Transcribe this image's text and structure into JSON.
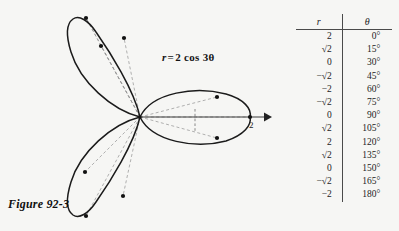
{
  "figure": {
    "caption": "Figure 92-3",
    "equation": {
      "lhs": "r",
      "equals": "=",
      "rhs": "2 cos 3θ",
      "full": "r = 2 cos 3θ"
    },
    "axis_label": "2",
    "background_color": "#f6f6f4",
    "curve_color": "#1a1a1a",
    "dashed_color": "#8a8a8a"
  },
  "table": {
    "headers": {
      "r": "r",
      "theta": "θ"
    },
    "rows": [
      {
        "r": "2",
        "theta": "0°"
      },
      {
        "r": "√2",
        "theta": "15°"
      },
      {
        "r": "0",
        "theta": "30°"
      },
      {
        "r": "−√2",
        "theta": "45°"
      },
      {
        "r": "−2",
        "theta": "60°"
      },
      {
        "r": "−√2",
        "theta": "75°"
      },
      {
        "r": "0",
        "theta": "90°"
      },
      {
        "r": "√2",
        "theta": "105°"
      },
      {
        "r": "2",
        "theta": "120°"
      },
      {
        "r": "√2",
        "theta": "135°"
      },
      {
        "r": "0",
        "theta": "150°"
      },
      {
        "r": "−√2",
        "theta": "165°"
      },
      {
        "r": "−2",
        "theta": "180°"
      }
    ]
  },
  "chart_data": {
    "type": "line",
    "subtype": "polar-rose",
    "equation": "r = 2 cos 3θ",
    "xlabel": "",
    "ylabel": "",
    "polar": true,
    "petal_count": 3,
    "max_radius": 2,
    "petal_axis_angles_deg": [
      0,
      120,
      240
    ],
    "theta_units": "degrees",
    "theta": [
      0,
      15,
      30,
      45,
      60,
      75,
      90,
      105,
      120,
      135,
      150,
      165,
      180
    ],
    "r": [
      2,
      1.414,
      0,
      -1.414,
      -2,
      -1.414,
      0,
      1.414,
      2,
      1.414,
      0,
      -1.414,
      -2
    ],
    "r_labels": [
      "2",
      "√2",
      "0",
      "−√2",
      "−2",
      "−√2",
      "0",
      "√2",
      "2",
      "√2",
      "0",
      "−√2",
      "−2"
    ],
    "marked_points_polar": [
      {
        "theta_deg": 0,
        "r": 2,
        "label": "2"
      },
      {
        "theta_deg": 15,
        "r": 1.414,
        "label": "√2"
      },
      {
        "theta_deg": 45,
        "r": -1.414,
        "label": "−√2"
      },
      {
        "theta_deg": 60,
        "r": -2,
        "label": "−2"
      },
      {
        "theta_deg": 75,
        "r": -1.414,
        "label": "−√2"
      },
      {
        "theta_deg": 105,
        "r": 1.414,
        "label": "√2"
      },
      {
        "theta_deg": 120,
        "r": 2,
        "label": "2"
      },
      {
        "theta_deg": 135,
        "r": 1.414,
        "label": "√2"
      },
      {
        "theta_deg": 165,
        "r": -1.414,
        "label": "−√2"
      },
      {
        "theta_deg": 180,
        "r": -2,
        "label": "−2"
      }
    ],
    "axis_tick_labels": [
      "2"
    ],
    "grid": false,
    "legend": null
  }
}
